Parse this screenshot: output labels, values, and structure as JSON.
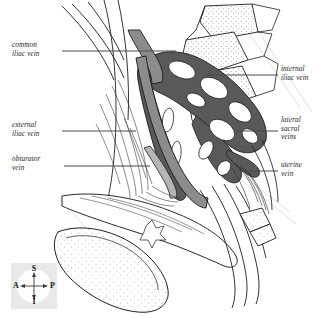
{
  "figure": {
    "kind": "anatomical-illustration",
    "background_color": "#ffffff",
    "line_color": "#1d1d1d",
    "vein_fill_dark": "#595959",
    "vein_fill_mid": "#8c8c8c",
    "vein_fill_light": "#b5b5b5",
    "bone_stipple_color": "#3a3a3a",
    "leader_line_color": "#4a4a4a"
  },
  "labels": {
    "left": [
      {
        "id": "common-iliac-vein",
        "text": "common\niliac vein",
        "x": 12,
        "y": 41,
        "leader": {
          "x1": 62,
          "y1": 51,
          "x2": 176,
          "y2": 51
        }
      },
      {
        "id": "external-iliac-vein",
        "text": "external\niliac vein",
        "x": 12,
        "y": 121,
        "leader": {
          "x1": 62,
          "y1": 131,
          "x2": 136,
          "y2": 131
        }
      },
      {
        "id": "obturator-vein",
        "text": "obturator\nvein",
        "x": 12,
        "y": 155,
        "leader": {
          "x1": 64,
          "y1": 166,
          "x2": 150,
          "y2": 166
        }
      }
    ],
    "right": [
      {
        "id": "internal-iliac-vein",
        "text": "internal\niliac vein",
        "x": 280,
        "y": 65,
        "leader": {
          "x1": 278,
          "y1": 75,
          "x2": 206,
          "y2": 75
        }
      },
      {
        "id": "lateral-sacral-veins",
        "text": "lateral\nsacral\nveins",
        "x": 280,
        "y": 116,
        "leader": {
          "x1": 278,
          "y1": 131,
          "x2": 236,
          "y2": 131
        }
      },
      {
        "id": "uterine-vein",
        "text": "uterine\nvein",
        "x": 280,
        "y": 161,
        "leader": {
          "x1": 278,
          "y1": 171,
          "x2": 238,
          "y2": 171
        }
      }
    ]
  },
  "orientation_compass": {
    "name": "anatomical-orientation-key",
    "superior": "S",
    "inferior": "I",
    "anterior": "A",
    "posterior": "P",
    "background_color": "#e9e9e9",
    "disc_color": "#fdfdfd"
  }
}
